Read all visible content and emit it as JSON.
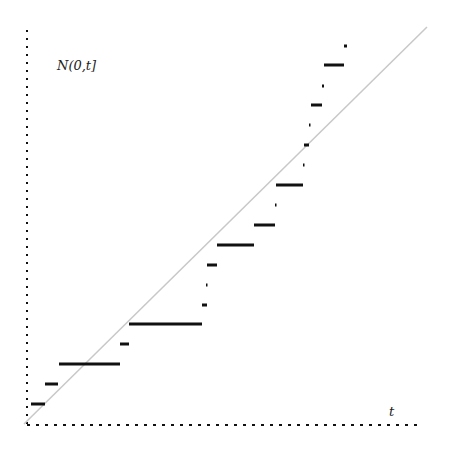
{
  "chart_data": {
    "type": "line",
    "subtype": "step (counting process with diagonal reference)",
    "title": "",
    "xlabel": "t",
    "ylabel": "N(0,t]",
    "grid": false,
    "legend": null,
    "axes": {
      "style": "dotted",
      "color": "#111111",
      "origin_px": [
        27,
        424
      ]
    },
    "reference_line": {
      "name": "expected count (y = t)",
      "color": "#c8c8c8",
      "from_px": [
        24,
        424
      ],
      "to_px": [
        427,
        27
      ]
    },
    "step_increment_px": 20,
    "steps": [
      {
        "level": 1,
        "x_start": 31,
        "x_end": 45,
        "y": 404
      },
      {
        "level": 2,
        "x_start": 45,
        "x_end": 58,
        "y": 384
      },
      {
        "level": 3,
        "x_start": 59,
        "x_end": 120,
        "y": 364
      },
      {
        "level": 4,
        "x_start": 120,
        "x_end": 129,
        "y": 344
      },
      {
        "level": 5,
        "x_start": 129,
        "x_end": 202,
        "y": 324
      },
      {
        "level": 6,
        "x_start": 202,
        "x_end": 207,
        "y": 305
      },
      {
        "level": 7,
        "x_start": 206,
        "x_end": 207,
        "y": 285
      },
      {
        "level": 8,
        "x_start": 207,
        "x_end": 217,
        "y": 265
      },
      {
        "level": 9,
        "x_start": 217,
        "x_end": 254,
        "y": 245
      },
      {
        "level": 10,
        "x_start": 254,
        "x_end": 275,
        "y": 225
      },
      {
        "level": 11,
        "x_start": 275,
        "x_end": 276,
        "y": 205
      },
      {
        "level": 12,
        "x_start": 276,
        "x_end": 303,
        "y": 185
      },
      {
        "level": 13,
        "x_start": 303,
        "x_end": 304,
        "y": 165
      },
      {
        "level": 14,
        "x_start": 304,
        "x_end": 309,
        "y": 145
      },
      {
        "level": 15,
        "x_start": 309,
        "x_end": 310,
        "y": 125
      },
      {
        "level": 16,
        "x_start": 311,
        "x_end": 322,
        "y": 105
      },
      {
        "level": 17,
        "x_start": 322,
        "x_end": 324,
        "y": 86
      },
      {
        "level": 18,
        "x_start": 324,
        "x_end": 344,
        "y": 65
      },
      {
        "level": 19,
        "x_start": 344,
        "x_end": 347,
        "y": 46
      }
    ],
    "step_color": "#111111"
  }
}
